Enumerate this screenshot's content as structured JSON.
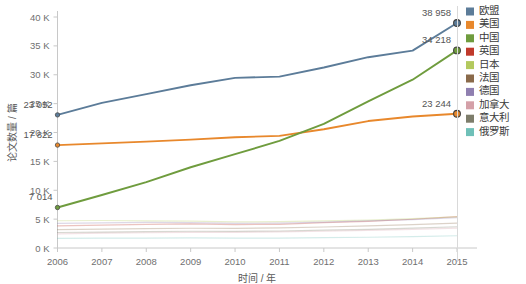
{
  "chart_data": {
    "type": "line",
    "title": "",
    "xlabel": "时间 / 年",
    "ylabel": "论文数量 / 篇",
    "categories": [
      "2006",
      "2007",
      "2008",
      "2009",
      "2010",
      "2011",
      "2012",
      "2013",
      "2014",
      "2015"
    ],
    "x": [
      2006,
      2007,
      2008,
      2009,
      2010,
      2011,
      2012,
      2013,
      2014,
      2015
    ],
    "xlim": [
      2006,
      2015
    ],
    "ylim": [
      0,
      40000
    ],
    "ytick_values": [
      0,
      5000,
      10000,
      15000,
      20000,
      25000,
      30000,
      35000,
      40000
    ],
    "ytick_labels": [
      "0 K",
      "5 K",
      "10 K",
      "15 K",
      "20 K",
      "25 K",
      "30 K",
      "35 K",
      "40 K"
    ],
    "grid": false,
    "legend_position": "right",
    "series": [
      {
        "name": "欧盟",
        "color": "#5c7c99",
        "values": [
          23052,
          25120,
          26650,
          28180,
          29460,
          29680,
          31260,
          33040,
          34180,
          38958
        ],
        "emphasis": true,
        "label_start": "23 052",
        "label_end": "38 958"
      },
      {
        "name": "美国",
        "color": "#e8882c",
        "values": [
          17822,
          18120,
          18420,
          18760,
          19180,
          19420,
          20560,
          21980,
          22760,
          23244
        ],
        "emphasis": true,
        "label_start": "17 822",
        "label_end": "23 244"
      },
      {
        "name": "中国",
        "color": "#6f9c3e",
        "values": [
          7014,
          9180,
          11420,
          13980,
          16240,
          18560,
          21480,
          25380,
          29140,
          34218
        ],
        "emphasis": true,
        "label_start": "7 014",
        "label_end": "34 218"
      },
      {
        "name": "英国",
        "color": "#c0392b",
        "values": [
          3820,
          3960,
          4080,
          4180,
          4060,
          4100,
          4380,
          4620,
          4980,
          5420
        ],
        "emphasis": false
      },
      {
        "name": "日本",
        "color": "#b3c95e",
        "values": [
          4720,
          4760,
          4700,
          4640,
          4520,
          4560,
          4680,
          4820,
          5080,
          5380
        ],
        "emphasis": false
      },
      {
        "name": "法国",
        "color": "#8a6a4a",
        "values": [
          3180,
          3280,
          3360,
          3420,
          3400,
          3480,
          3640,
          3820,
          4060,
          4320
        ],
        "emphasis": false
      },
      {
        "name": "德国",
        "color": "#8f7fb0",
        "values": [
          4280,
          4360,
          4420,
          4380,
          4260,
          4320,
          4480,
          4680,
          4920,
          5240
        ],
        "emphasis": false
      },
      {
        "name": "加拿大",
        "color": "#d4a0a8",
        "values": [
          2460,
          2560,
          2640,
          2700,
          2720,
          2780,
          2900,
          3040,
          3220,
          3440
        ],
        "emphasis": false
      },
      {
        "name": "意大利",
        "color": "#7d7d6b",
        "values": [
          2680,
          2760,
          2840,
          2900,
          2880,
          2940,
          3080,
          3240,
          3440,
          3680
        ],
        "emphasis": false
      },
      {
        "name": "俄罗斯",
        "color": "#6fc0b8",
        "values": [
          1680,
          1700,
          1720,
          1740,
          1700,
          1720,
          1780,
          1860,
          1980,
          2120
        ],
        "emphasis": false
      }
    ]
  },
  "legend": {
    "items": [
      {
        "label": "欧盟",
        "color": "#5c7c99"
      },
      {
        "label": "美国",
        "color": "#e8882c"
      },
      {
        "label": "中国",
        "color": "#6f9c3e"
      },
      {
        "label": "英国",
        "color": "#c0392b"
      },
      {
        "label": "日本",
        "color": "#b3c95e"
      },
      {
        "label": "法国",
        "color": "#8a6a4a"
      },
      {
        "label": "德国",
        "color": "#8f7fb0"
      },
      {
        "label": "加拿大",
        "color": "#d4a0a8"
      },
      {
        "label": "意大利",
        "color": "#7d7d6b"
      },
      {
        "label": "俄罗斯",
        "color": "#6fc0b8"
      }
    ]
  },
  "colors": {
    "background": "#ffffff",
    "axis": "#c8c8c8",
    "tick_text": "#6f6f6f",
    "label_text": "#555555",
    "legend_divider": "#d9d9d9"
  }
}
